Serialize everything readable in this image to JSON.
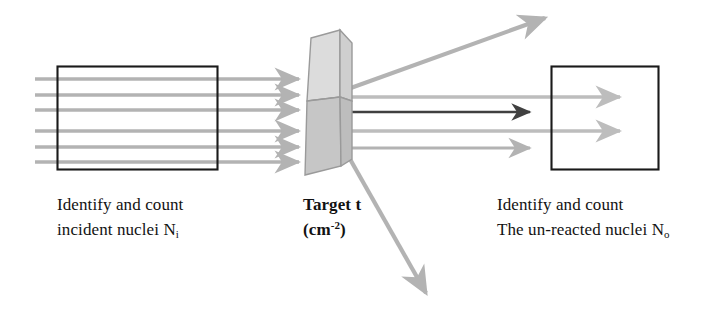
{
  "figure": {
    "background_color": "#ffffff"
  },
  "colors": {
    "beam_gray": "#b3b3b3",
    "beam_gray_light": "#bdbdbd",
    "beam_dark": "#404040",
    "box_stroke": "#1a1a1a",
    "target_face_light": "#dcdcdc",
    "target_face_mid": "#c3c3c3",
    "target_edge": "#a8a8a8",
    "target_outline": "#8f8f8f",
    "text": "#121212"
  },
  "captions": {
    "left": {
      "line1": "Identify and count",
      "line2_prefix": "incident nuclei N",
      "line2_subscript": "i"
    },
    "target": {
      "line1": "Target t",
      "line2_prefix": "(cm",
      "line2_superscript": "-2",
      "line2_suffix": ")"
    },
    "right": {
      "line1": "Identify and count",
      "line2_prefix": "The un-reacted nuclei N",
      "line2_subscript": "o"
    }
  },
  "diagram": {
    "detector_left": {
      "label": "incident-beam-counter-box",
      "x": 57,
      "y": 66,
      "width": 161,
      "height": 104
    },
    "detector_right": {
      "label": "unreacted-beam-counter-box",
      "x": 551,
      "y": 66,
      "width": 108,
      "height": 104
    },
    "target": {
      "label": "target-foil-slab",
      "front_top_face": "310,38 340,30 340,96 306,100",
      "front_bottom_face": "306,100 340,96 341,166 304,174",
      "side_face": "340,30 352,42 353,100 340,96",
      "side_face_lower": "340,96 353,100 353,160 341,166"
    },
    "incident_beams": [
      {
        "name": "incident-beam-1",
        "x1": 35,
        "y1": 79,
        "x2": 300,
        "y2": 79
      },
      {
        "name": "incident-beam-2",
        "x1": 35,
        "y1": 95,
        "x2": 300,
        "y2": 95
      },
      {
        "name": "incident-beam-3",
        "x1": 35,
        "y1": 110,
        "x2": 300,
        "y2": 110
      },
      {
        "name": "incident-beam-4",
        "x1": 35,
        "y1": 131,
        "x2": 300,
        "y2": 131
      },
      {
        "name": "incident-beam-5",
        "x1": 35,
        "y1": 147,
        "x2": 300,
        "y2": 147
      },
      {
        "name": "incident-beam-6",
        "x1": 35,
        "y1": 162,
        "x2": 300,
        "y2": 162
      }
    ],
    "transmitted_beams": [
      {
        "name": "transmitted-beam-1",
        "x1": 352,
        "y1": 97,
        "x2": 622,
        "y2": 97,
        "color": "#bdbdbd"
      },
      {
        "name": "transmitted-beam-2-dark",
        "x1": 352,
        "y1": 112,
        "x2": 532,
        "y2": 112,
        "color": "#404040"
      },
      {
        "name": "transmitted-beam-3",
        "x1": 352,
        "y1": 131,
        "x2": 622,
        "y2": 131,
        "color": "#bdbdbd"
      },
      {
        "name": "transmitted-beam-4",
        "x1": 352,
        "y1": 148,
        "x2": 532,
        "y2": 148,
        "color": "#b3b3b3"
      }
    ],
    "scattered_beams": [
      {
        "name": "scattered-beam-up",
        "x1": 350,
        "y1": 88,
        "x2": 548,
        "y2": 16
      },
      {
        "name": "scattered-beam-down",
        "x1": 343,
        "y1": 146,
        "x2": 428,
        "y2": 297
      }
    ]
  }
}
